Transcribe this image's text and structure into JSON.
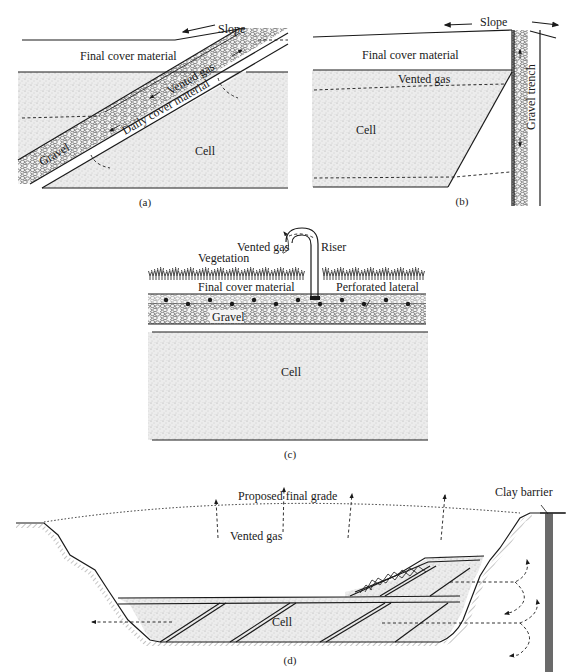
{
  "figure": {
    "panels": [
      {
        "id": "a",
        "caption": "(a)",
        "labels": {
          "slope": "Slope",
          "final_cover": "Final cover material",
          "vented_gas": "Vented gas",
          "daily_cover": "Daily cover material",
          "gravel": "Gravel",
          "cell": "Cell"
        }
      },
      {
        "id": "b",
        "caption": "(b)",
        "labels": {
          "slope": "Slope",
          "final_cover": "Final cover material",
          "vented_gas": "Vented gas",
          "cell": "Cell",
          "gravel_trench": "Gravel trench"
        }
      },
      {
        "id": "c",
        "caption": "(c)",
        "labels": {
          "vented_gas": "Vented gas",
          "riser": "Riser",
          "vegetation": "Vegetation",
          "final_cover": "Final cover material",
          "perforated_lateral": "Perforated lateral",
          "gravel": "Gravel",
          "cell": "Cell"
        }
      },
      {
        "id": "d",
        "caption": "(d)",
        "labels": {
          "proposed_grade": "Proposed final grade",
          "vented_gas": "Vented gas",
          "clay_barrier": "Clay barrier",
          "cell": "Cell"
        }
      }
    ],
    "colors": {
      "ink": "#1a1a1a",
      "cell_fill": "#e9e9e9",
      "gravel_fill": "#f2f2f2",
      "clay_barrier": "#6a6a6a"
    }
  }
}
